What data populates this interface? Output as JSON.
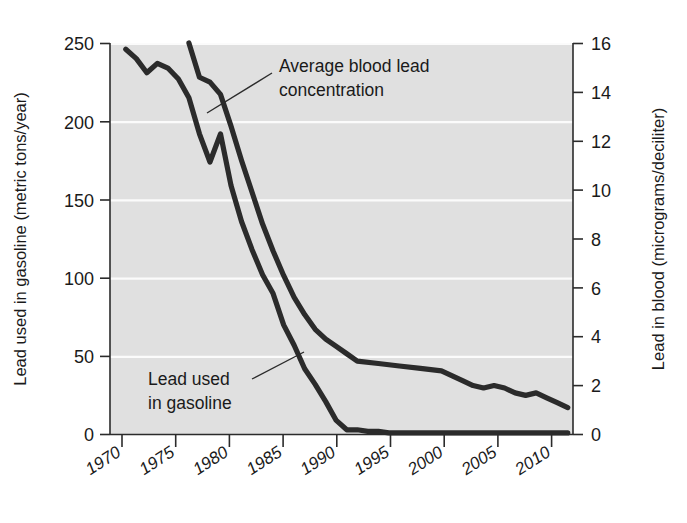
{
  "chart_data": {
    "type": "line",
    "title": "",
    "xlabel": "",
    "ylabel": "Lead used in gasoline (metric tons/year)",
    "y2label": "Lead in blood (micrograms/deciliter)",
    "xlim": [
      1968.5,
      2012.5
    ],
    "ylim": [
      0,
      250
    ],
    "y2lim": [
      0,
      16
    ],
    "xticks": [
      1970,
      1975,
      1980,
      1985,
      1990,
      1995,
      2000,
      2005,
      2010
    ],
    "xtick_labels": [
      "1970",
      "1975",
      "1980",
      "1985",
      "1990",
      "1995",
      "2000",
      "2005",
      "2010"
    ],
    "yticks": [
      0,
      50,
      100,
      150,
      200,
      250
    ],
    "ytick_labels": [
      "0",
      "50",
      "100",
      "150",
      "200",
      "250"
    ],
    "y2ticks": [
      0,
      2,
      4,
      6,
      8,
      10,
      12,
      14,
      16
    ],
    "y2tick_labels": [
      "0",
      "2",
      "4",
      "6",
      "8",
      "10",
      "12",
      "14",
      "16"
    ],
    "grid": true,
    "grid_color": "#fbfbfb",
    "plot_background": "#e0e0e0",
    "line_color": "#2b2b2b",
    "legend_position": "inline-annotations",
    "series": [
      {
        "name": "Lead used in gasoline",
        "axis": "left",
        "units": "metric tons/year",
        "x": [
          1970,
          1971,
          1972,
          1973,
          1974,
          1975,
          1976,
          1977,
          1978,
          1979,
          1980,
          1981,
          1982,
          1983,
          1984,
          1985,
          1986,
          1987,
          1988,
          1989,
          1990,
          1991,
          1992,
          1993,
          1994,
          1995,
          1996,
          2000,
          2005,
          2010,
          2012
        ],
        "y": [
          246,
          240,
          231,
          237,
          234,
          227,
          215,
          192,
          174,
          192,
          159,
          136,
          118,
          102,
          90,
          70,
          57,
          42,
          32,
          21,
          9,
          3,
          3,
          2,
          2,
          1,
          1,
          1,
          1,
          1,
          1
        ]
      },
      {
        "name": "Average blood lead concentration",
        "axis": "right",
        "units": "micrograms/deciliter",
        "x": [
          1976,
          1977,
          1978,
          1979,
          1980,
          1981,
          1982,
          1983,
          1984,
          1985,
          1986,
          1987,
          1988,
          1989,
          1990,
          1991,
          1992,
          1994,
          1996,
          1998,
          2000,
          2002,
          2003,
          2004,
          2005,
          2006,
          2007,
          2008,
          2009,
          2010,
          2011,
          2012
        ],
        "y": [
          16.0,
          14.6,
          14.4,
          13.9,
          12.6,
          11.2,
          9.9,
          8.6,
          7.5,
          6.5,
          5.6,
          4.9,
          4.3,
          3.9,
          3.6,
          3.3,
          3.0,
          2.9,
          2.8,
          2.7,
          2.6,
          2.2,
          2.0,
          1.9,
          2.0,
          1.9,
          1.7,
          1.6,
          1.7,
          1.5,
          1.3,
          1.1
        ]
      }
    ],
    "annotations": [
      {
        "name": "blood-lead-annotation",
        "text_line_1": "Average blood lead",
        "text_line_2": "concentration",
        "leader_from": [
          275,
          72
        ],
        "leader_to": [
          207,
          113
        ]
      },
      {
        "name": "gasoline-annotation",
        "text_line_1": "Lead used",
        "text_line_2": "in gasoline",
        "leader_from": [
          252,
          378
        ],
        "leader_to": [
          303,
          352
        ]
      }
    ]
  }
}
